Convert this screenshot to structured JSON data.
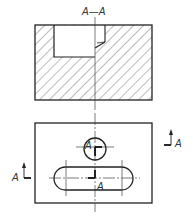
{
  "drawing": {
    "type": "engineering section view",
    "section_title": "A—A",
    "section_view": {
      "hatched": true,
      "outline": {
        "x": 35,
        "y": 25,
        "w": 117,
        "h": 75
      },
      "pocket": {
        "x": 54,
        "y": 26,
        "w": 51,
        "h": 31
      }
    },
    "plan_view": {
      "outline": {
        "x": 35,
        "y": 123,
        "w": 117,
        "h": 80
      },
      "hole": {
        "cx": 95,
        "cy": 149,
        "r": 11
      },
      "slot": {
        "x": 54,
        "y": 167,
        "w": 79,
        "h": 23
      }
    },
    "labels": {
      "cut_left": "A",
      "cut_right": "A",
      "hole_label": "A",
      "slot_label": "A"
    },
    "colors": {
      "line": "#222222",
      "hatch": "#555555",
      "centerline": "#444444",
      "background": "#ffffff"
    }
  }
}
